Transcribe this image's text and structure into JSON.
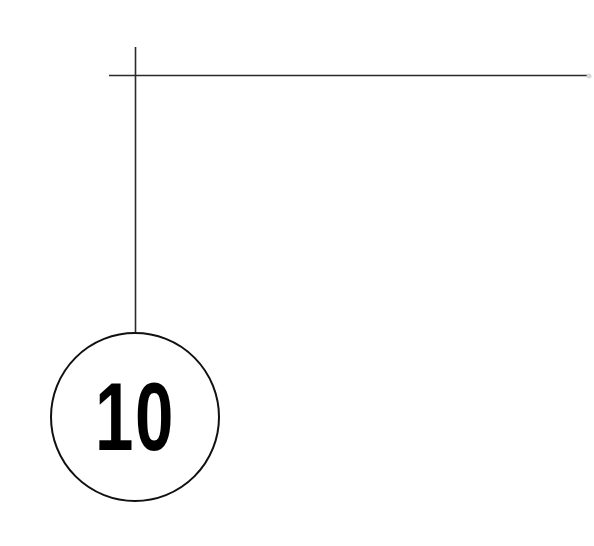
{
  "callout": {
    "number": "10",
    "line_color": "#2a2a2a",
    "circle_color": "#111111",
    "text_color": "#000000"
  }
}
